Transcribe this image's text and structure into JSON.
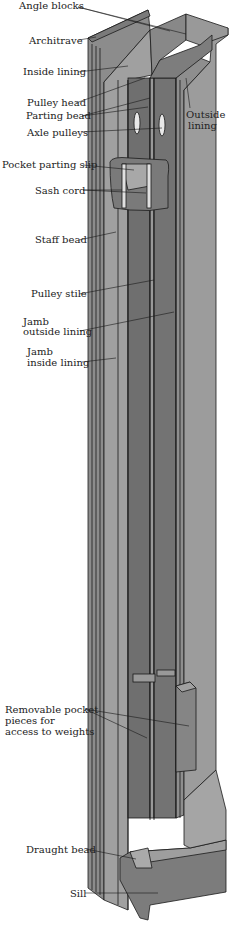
{
  "diagram": {
    "colors": {
      "light": "#9a9a9a",
      "mid": "#808080",
      "dark": "#6a6a6a",
      "outline": "#1a1a1a",
      "background": "#ffffff"
    },
    "labels": [
      {
        "id": "angle-blocks",
        "text": "Angle blocks"
      },
      {
        "id": "architrave",
        "text": "Architrave"
      },
      {
        "id": "inside-lining",
        "text": "Inside lining"
      },
      {
        "id": "pulley-head",
        "text": "Pulley head"
      },
      {
        "id": "parting-bead",
        "text": "Parting bead"
      },
      {
        "id": "axle-pulleys",
        "text": "Axle pulleys"
      },
      {
        "id": "outside-lining-1",
        "text": "Outside"
      },
      {
        "id": "outside-lining-2",
        "text": "lining"
      },
      {
        "id": "pocket-parting-slip",
        "text": "Pocket parting slip"
      },
      {
        "id": "sash-cord",
        "text": "Sash cord"
      },
      {
        "id": "staff-bead",
        "text": "Staff bead"
      },
      {
        "id": "pulley-stile",
        "text": "Pulley stile"
      },
      {
        "id": "jamb-outside-1",
        "text": "Jamb"
      },
      {
        "id": "jamb-outside-2",
        "text": "outside lining"
      },
      {
        "id": "jamb-inside-1",
        "text": "Jamb"
      },
      {
        "id": "jamb-inside-2",
        "text": "inside lining"
      },
      {
        "id": "removable-1",
        "text": "Removable pocket"
      },
      {
        "id": "removable-2",
        "text": "pieces for"
      },
      {
        "id": "removable-3",
        "text": "access to weights"
      },
      {
        "id": "draught-bead",
        "text": "Draught bead"
      },
      {
        "id": "sill",
        "text": "Sill"
      }
    ]
  }
}
